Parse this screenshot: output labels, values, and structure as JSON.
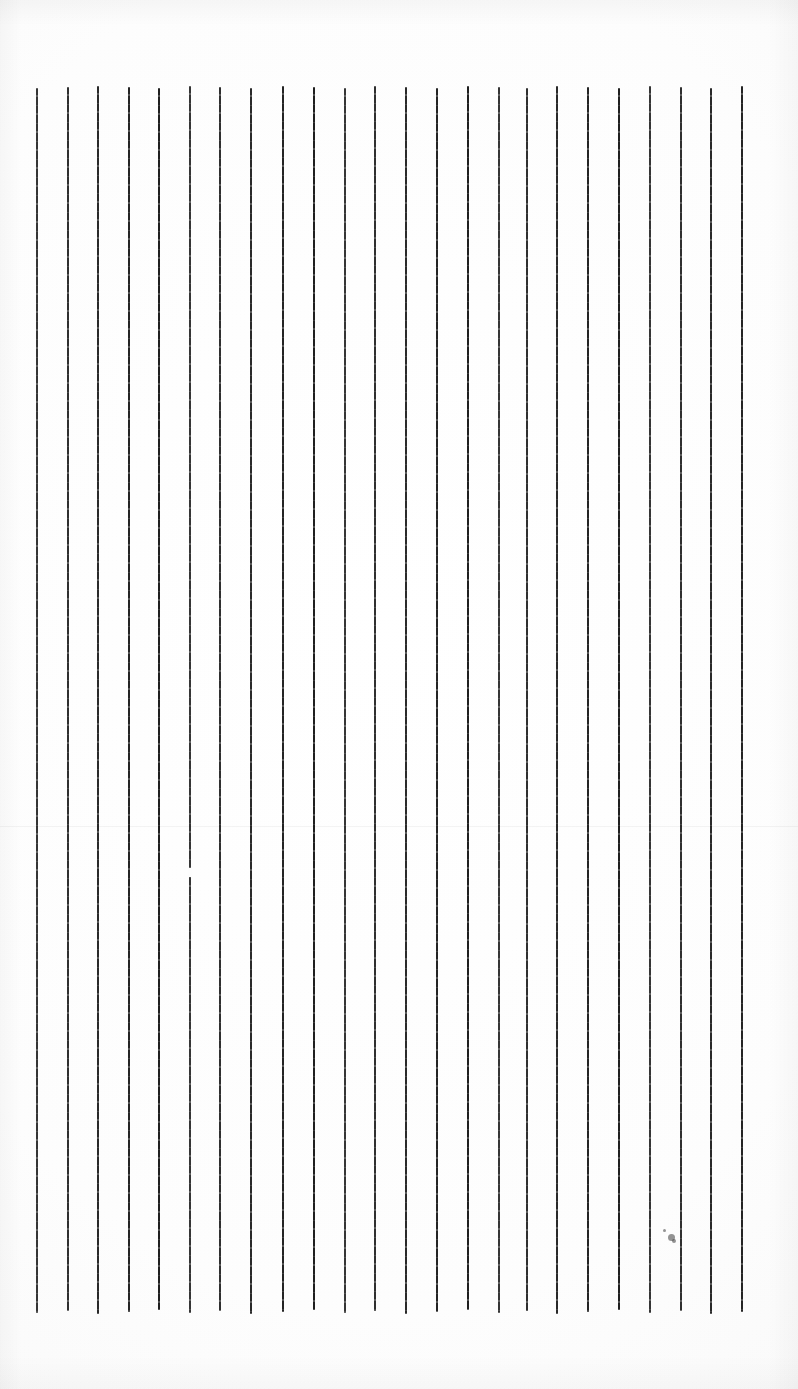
{
  "image": {
    "kind": "scanned-ruled-paper",
    "description": "Scanned blank sheet with a series of evenly spaced vertical hand-ruled ink lines",
    "width": 798,
    "height": 1389,
    "background_color": "#fdfdfd",
    "ink_color": "#1a1a1a"
  },
  "ruling": {
    "orientation": "vertical",
    "line_count": 24,
    "line_thickness_px": 2,
    "nominal_spacing_px": 30.7,
    "first_line_x": 37,
    "last_line_x": 742,
    "top_y": 86,
    "bottom_y": 1312,
    "lines": [
      {
        "x": 37,
        "top": 88,
        "bottom": 1313
      },
      {
        "x": 68,
        "top": 87,
        "bottom": 1311
      },
      {
        "x": 98,
        "top": 86,
        "bottom": 1314
      },
      {
        "x": 129,
        "top": 87,
        "bottom": 1312
      },
      {
        "x": 159,
        "top": 88,
        "bottom": 1310
      },
      {
        "x": 190,
        "top": 86,
        "bottom": 1313
      },
      {
        "x": 220,
        "top": 87,
        "bottom": 1311
      },
      {
        "x": 251,
        "top": 88,
        "bottom": 1314
      },
      {
        "x": 283,
        "top": 86,
        "bottom": 1312
      },
      {
        "x": 314,
        "top": 87,
        "bottom": 1310
      },
      {
        "x": 345,
        "top": 88,
        "bottom": 1313
      },
      {
        "x": 375,
        "top": 86,
        "bottom": 1311
      },
      {
        "x": 406,
        "top": 87,
        "bottom": 1314
      },
      {
        "x": 437,
        "top": 88,
        "bottom": 1312
      },
      {
        "x": 468,
        "top": 86,
        "bottom": 1310
      },
      {
        "x": 499,
        "top": 87,
        "bottom": 1313
      },
      {
        "x": 527,
        "top": 88,
        "bottom": 1311
      },
      {
        "x": 557,
        "top": 86,
        "bottom": 1314
      },
      {
        "x": 588,
        "top": 87,
        "bottom": 1312
      },
      {
        "x": 619,
        "top": 88,
        "bottom": 1310
      },
      {
        "x": 650,
        "top": 86,
        "bottom": 1313
      },
      {
        "x": 681,
        "top": 87,
        "bottom": 1311
      },
      {
        "x": 711,
        "top": 88,
        "bottom": 1314
      },
      {
        "x": 742,
        "top": 86,
        "bottom": 1312
      }
    ]
  },
  "artifacts": {
    "scan_seam_y": 826,
    "specks": [
      {
        "x": 668,
        "y": 1234,
        "size": 7
      },
      {
        "x": 672,
        "y": 1239,
        "size": 4
      },
      {
        "x": 663,
        "y": 1229,
        "size": 3
      }
    ],
    "line_gaps": [
      {
        "x": 190,
        "y": 868,
        "height": 9
      }
    ]
  },
  "margins": {
    "top_blank_px": 86,
    "bottom_blank_px": 77,
    "left_blank_px": 37,
    "right_blank_px": 56
  }
}
